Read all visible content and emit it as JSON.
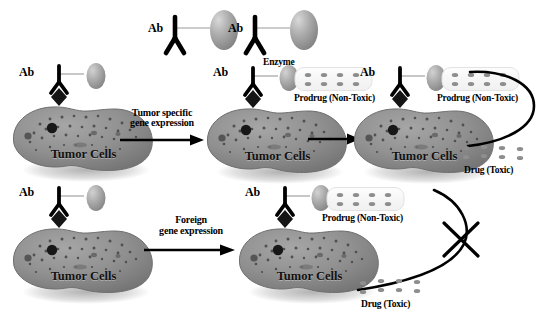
{
  "figure": {
    "background": "#ffffff",
    "ink": "#000000",
    "cell_fill": "#8a8a8a",
    "cell_edge": "#6d6d6d",
    "enzyme_fill": "#9b9b9b",
    "drug_dot": "#8e8e8e"
  },
  "labels": {
    "ab": "Ab",
    "enzyme": "Enzyme",
    "prodrug": "Prodrug (Non-Toxic)",
    "drug": "Drug (Toxic)",
    "tumor_cells": "Tumor Cells",
    "flow_top_line1": "Tumor specific",
    "flow_top_line2": "gene expression",
    "flow_bottom_line1": "Foreign",
    "flow_bottom_line2": "gene expression"
  },
  "top_row": {
    "free_conjugates": [
      {
        "ab": "Ab"
      },
      {
        "ab": "Ab"
      }
    ],
    "cells": [
      {
        "name": "tumor-cell-top-left",
        "ab": "Ab",
        "has_enzyme": true,
        "has_prodrug": false
      },
      {
        "name": "tumor-cell-top-middle",
        "ab": "Ab",
        "has_enzyme": true,
        "has_prodrug": true
      },
      {
        "name": "tumor-cell-top-right",
        "ab": "Ab",
        "has_enzyme": true,
        "has_prodrug": true
      }
    ],
    "arrow_label": {
      "line1": "Tumor specific",
      "line2": "gene expression"
    },
    "conversion": {
      "blocked": false,
      "from": "Prodrug (Non-Toxic)",
      "to": "Drug (Toxic)"
    }
  },
  "bottom_row": {
    "cells": [
      {
        "name": "tumor-cell-bottom-left",
        "ab": "Ab",
        "has_enzyme": true,
        "has_prodrug": false
      },
      {
        "name": "tumor-cell-bottom-right",
        "ab": "Ab",
        "has_enzyme": true,
        "has_prodrug": true
      }
    ],
    "arrow_label": {
      "line1": "Foreign",
      "line2": "gene expression"
    },
    "conversion": {
      "blocked": true,
      "from": "Prodrug (Non-Toxic)",
      "to": "Drug (Toxic)"
    }
  },
  "drug_clusters": {
    "top_row_count": 4,
    "bottom_row_count": 4
  }
}
